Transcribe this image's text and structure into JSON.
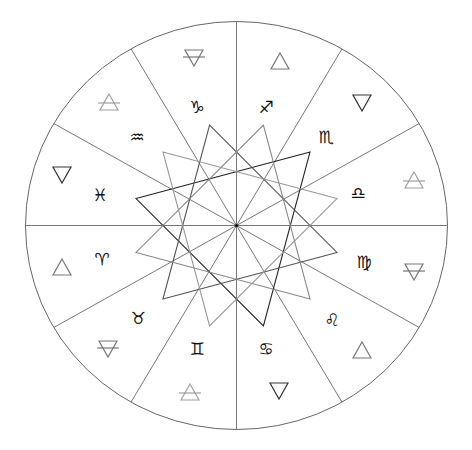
{
  "diagram": {
    "center": {
      "x": 236.5,
      "y": 225.5
    },
    "radius_x": 211,
    "radius_y": 204,
    "spoke_angles_deg": [
      0,
      30,
      60,
      90,
      120,
      150,
      180,
      210,
      240,
      270,
      300,
      330
    ],
    "star_radius": 104,
    "star_triangles": [
      {
        "name": "dark",
        "angles_deg": [
          45,
          165,
          285
        ],
        "color": "#222222"
      },
      {
        "name": "medium-dark",
        "angles_deg": [
          -15,
          105,
          225
        ],
        "color": "#555555"
      },
      {
        "name": "medium",
        "angles_deg": [
          15,
          135,
          255
        ],
        "color": "#888888"
      },
      {
        "name": "light",
        "angles_deg": [
          75,
          195,
          315
        ],
        "color": "#999999"
      }
    ],
    "colors": {
      "fire": "#777777",
      "water": "#333333",
      "air": "#a0a0a0",
      "earth": "#777777",
      "sign": "#111111",
      "outline": "#666666"
    },
    "signs": [
      {
        "name": "Capricorn",
        "glyph": "♑",
        "x": 197,
        "y": 107,
        "element": "earth",
        "ex": 194,
        "ey": 58
      },
      {
        "name": "Aquarius",
        "glyph": "♒",
        "x": 137,
        "y": 137,
        "element": "air",
        "ex": 109,
        "ey": 102
      },
      {
        "name": "Pisces",
        "glyph": "♓",
        "x": 100,
        "y": 195,
        "element": "water",
        "ex": 62,
        "ey": 175
      },
      {
        "name": "Aries",
        "glyph": "♈",
        "x": 102,
        "y": 259,
        "element": "fire",
        "ex": 62,
        "ey": 267
      },
      {
        "name": "Taurus",
        "glyph": "♉",
        "x": 138,
        "y": 318,
        "element": "earth",
        "ex": 108,
        "ey": 349
      },
      {
        "name": "Gemini",
        "glyph": "♊",
        "x": 197,
        "y": 349,
        "element": "air",
        "ex": 190,
        "ey": 392
      },
      {
        "name": "Cancer",
        "glyph": "♋",
        "x": 266,
        "y": 349,
        "element": "water",
        "ex": 279,
        "ey": 391
      },
      {
        "name": "Leo",
        "glyph": "♌",
        "x": 332,
        "y": 320,
        "element": "fire",
        "ex": 362,
        "ey": 350
      },
      {
        "name": "Virgo",
        "glyph": "♍",
        "x": 364,
        "y": 262,
        "element": "earth",
        "ex": 414,
        "ey": 272
      },
      {
        "name": "Libra",
        "glyph": "♎",
        "x": 358,
        "y": 193,
        "element": "air",
        "ex": 414,
        "ey": 180
      },
      {
        "name": "Scorpio",
        "glyph": "♏",
        "x": 326,
        "y": 137,
        "element": "water",
        "ex": 362,
        "ey": 103
      },
      {
        "name": "Sagittarius",
        "glyph": "♐",
        "x": 266,
        "y": 107,
        "element": "fire",
        "ex": 280,
        "ey": 61
      }
    ]
  }
}
